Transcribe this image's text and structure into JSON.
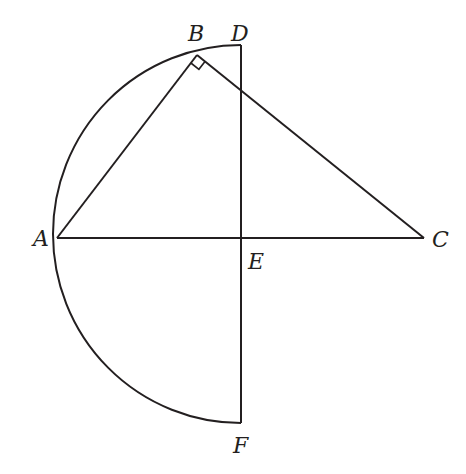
{
  "diagram": {
    "type": "geometry",
    "colors": {
      "stroke": "#231f20",
      "background": "#ffffff"
    },
    "points": {
      "A": {
        "label": "A",
        "x": 57,
        "y": 238
      },
      "B": {
        "label": "B",
        "x": 197,
        "y": 55
      },
      "C": {
        "label": "C",
        "x": 424,
        "y": 238
      },
      "D": {
        "label": "D",
        "x": 241,
        "y": 45
      },
      "E": {
        "label": "E",
        "x": 241,
        "y": 238
      },
      "F": {
        "label": "F",
        "x": 241,
        "y": 423
      }
    },
    "segments": [
      "AB",
      "BC",
      "AC",
      "DF"
    ],
    "arcs": [
      "D-A-F semicircle"
    ],
    "right_angle_marks": [
      "ABC"
    ]
  }
}
